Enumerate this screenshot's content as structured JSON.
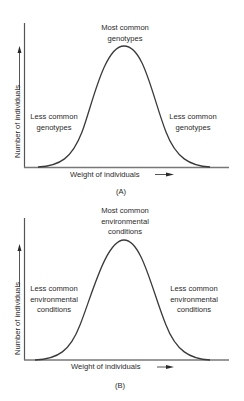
{
  "panels": [
    {
      "id": "A",
      "caption": "(A)",
      "peak_label": [
        "Most common",
        "genotypes"
      ],
      "left_label": [
        "Less common",
        "genotypes"
      ],
      "right_label": [
        "Less common",
        "genotypes"
      ],
      "xlabel": "Weight of individuals",
      "ylabel": "Number of individuals"
    },
    {
      "id": "B",
      "caption": "(B)",
      "peak_label": [
        "Most common",
        "environmental",
        "conditions"
      ],
      "left_label": [
        "Less common",
        "environmental",
        "conditions"
      ],
      "right_label": [
        "Less common",
        "environmental",
        "conditions"
      ],
      "xlabel": "Weight of individuals",
      "ylabel": "Number of individuals"
    }
  ],
  "colors": {
    "curve": "#3a3a3a",
    "axis": "#555555",
    "text": "#2a2a2a"
  }
}
